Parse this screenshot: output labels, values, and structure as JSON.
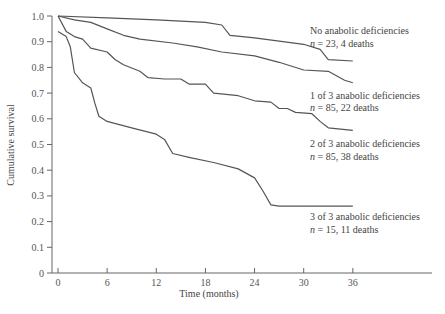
{
  "chart_data": {
    "type": "line",
    "title": "",
    "xlabel": "Time (months)",
    "ylabel": "Cumulative survival",
    "xlim": [
      0,
      48
    ],
    "ylim": [
      0,
      1.0
    ],
    "x_ticks": [
      0,
      6,
      12,
      18,
      24,
      30,
      36
    ],
    "y_ticks": [
      0,
      0.1,
      0.2,
      0.3,
      0.4,
      0.5,
      0.6,
      0.7,
      0.8,
      0.9,
      1.0
    ],
    "y_tick_labels": [
      "0",
      "0.1",
      "0.2",
      "0.3",
      "0.4",
      "0.5",
      "0.6",
      "0.7",
      "0.8",
      "0.9",
      "1.0"
    ],
    "grid": false,
    "legend_position": "inline-right",
    "series": [
      {
        "name": "No anabolic deficiencies",
        "annotation": "n = 23, 4 deaths",
        "points": [
          [
            0,
            1.0
          ],
          [
            6,
            0.993
          ],
          [
            12,
            0.985
          ],
          [
            18,
            0.975
          ],
          [
            20,
            0.965
          ],
          [
            21,
            0.925
          ],
          [
            24,
            0.915
          ],
          [
            30,
            0.89
          ],
          [
            32,
            0.87
          ],
          [
            33,
            0.83
          ],
          [
            36,
            0.825
          ]
        ]
      },
      {
        "name": "1 of 3 anabolic deficiencies",
        "annotation": "n = 85, 22 deaths",
        "points": [
          [
            0,
            1.0
          ],
          [
            2,
            0.985
          ],
          [
            4,
            0.975
          ],
          [
            6,
            0.95
          ],
          [
            8,
            0.925
          ],
          [
            10,
            0.91
          ],
          [
            14,
            0.895
          ],
          [
            17,
            0.88
          ],
          [
            20,
            0.86
          ],
          [
            24,
            0.845
          ],
          [
            27,
            0.82
          ],
          [
            30,
            0.79
          ],
          [
            33,
            0.785
          ],
          [
            35,
            0.75
          ],
          [
            36,
            0.74
          ]
        ]
      },
      {
        "name": "2 of 3 anabolic deficiencies",
        "annotation": "n = 85, 38 deaths",
        "points": [
          [
            0,
            1.0
          ],
          [
            1,
            0.94
          ],
          [
            2,
            0.92
          ],
          [
            3,
            0.91
          ],
          [
            4,
            0.875
          ],
          [
            6,
            0.86
          ],
          [
            7,
            0.83
          ],
          [
            8,
            0.81
          ],
          [
            10,
            0.785
          ],
          [
            11,
            0.76
          ],
          [
            13,
            0.755
          ],
          [
            15,
            0.755
          ],
          [
            16,
            0.735
          ],
          [
            18,
            0.735
          ],
          [
            19,
            0.7
          ],
          [
            22,
            0.69
          ],
          [
            24,
            0.67
          ],
          [
            26,
            0.665
          ],
          [
            27,
            0.64
          ],
          [
            28,
            0.64
          ],
          [
            29,
            0.625
          ],
          [
            31,
            0.62
          ],
          [
            32,
            0.59
          ],
          [
            33,
            0.565
          ],
          [
            36,
            0.555
          ]
        ]
      },
      {
        "name": "3 of 3 anabolic deficiencies",
        "annotation": "n = 15, 11 deaths",
        "points": [
          [
            0,
            0.94
          ],
          [
            1,
            0.92
          ],
          [
            1.5,
            0.88
          ],
          [
            2,
            0.78
          ],
          [
            3,
            0.74
          ],
          [
            4,
            0.72
          ],
          [
            4.5,
            0.66
          ],
          [
            5,
            0.61
          ],
          [
            6,
            0.59
          ],
          [
            9,
            0.565
          ],
          [
            12,
            0.54
          ],
          [
            13,
            0.52
          ],
          [
            14,
            0.465
          ],
          [
            16,
            0.45
          ],
          [
            19,
            0.43
          ],
          [
            22,
            0.405
          ],
          [
            24,
            0.37
          ],
          [
            25,
            0.32
          ],
          [
            26,
            0.265
          ],
          [
            27,
            0.26
          ],
          [
            36,
            0.26
          ]
        ]
      }
    ]
  },
  "axes": {
    "xlabel": "Time (months)",
    "ylabel": "Cumulative survival"
  },
  "legend": [
    {
      "label": "No anabolic deficiencies",
      "sub": "n = 23, 4 deaths"
    },
    {
      "label": "1 of 3 anabolic deficiencies",
      "sub": "n = 85, 22 deaths"
    },
    {
      "label": "2 of 3 anabolic deficiencies",
      "sub": "n = 85, 38 deaths"
    },
    {
      "label": "3 of 3 anabolic deficiencies",
      "sub": "n = 15, 11 deaths"
    }
  ]
}
